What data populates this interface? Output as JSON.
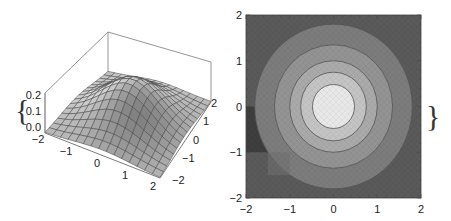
{
  "chart_data": [
    {
      "type": "surface3d",
      "title": "",
      "function": "gaussian bump z = 0.25*exp(-(x^2+y^2)/2)",
      "xlabel": "",
      "ylabel": "",
      "zlabel": "",
      "x_ticks": [
        "-2",
        "-1",
        "0",
        "1",
        "2"
      ],
      "y_ticks": [
        "-2",
        "-1",
        "0",
        "1",
        "2"
      ],
      "z_ticks": [
        "0.0",
        "0.1",
        "0.2"
      ],
      "xlim": [
        -2,
        2
      ],
      "ylim": [
        -2,
        2
      ],
      "zlim": [
        0,
        0.25
      ],
      "mesh_lines": 15,
      "annotation": "{",
      "fill_color": "#b8b8b8",
      "mesh_color": "#3a3a3a",
      "box_color": "#8a8a8a"
    },
    {
      "type": "contour",
      "title": "",
      "xlabel": "",
      "ylabel": "",
      "x_ticks": [
        "-2",
        "-1",
        "0",
        "1",
        "2"
      ],
      "y_ticks": [
        "-2",
        "-1",
        "0",
        "1",
        "2"
      ],
      "xlim": [
        -2,
        2
      ],
      "ylim": [
        -2,
        2
      ],
      "center": [
        0,
        0
      ],
      "contour_radii": [
        1.8,
        1.35,
        1.0,
        0.75,
        0.48
      ],
      "band_colors": [
        "#5a5a5a",
        "#7c7c7c",
        "#939393",
        "#aaaaaa",
        "#c4c4c4",
        "#e8e8e8"
      ],
      "artifact_colors": [
        "#3e3e3e",
        "#6f6f6f"
      ],
      "annotation": "}"
    }
  ]
}
